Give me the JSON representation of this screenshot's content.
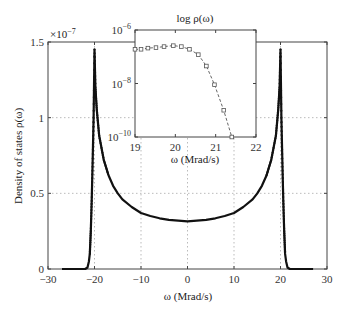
{
  "chart_data": [
    {
      "type": "scatter",
      "title": "",
      "xlabel": "ω (Mrad/s)",
      "ylabel": "Density of states ρ(ω)",
      "y_multiplier": "×10^-7",
      "xlim": [
        -30,
        30
      ],
      "ylim": [
        0,
        1.5
      ],
      "grid": true,
      "xticks": [
        -30,
        -20,
        -10,
        0,
        10,
        20,
        30
      ],
      "xtick_labels": [
        "−30",
        "−20",
        "−10",
        "0",
        "10",
        "20",
        "30"
      ],
      "yticks": [
        0,
        0.5,
        1,
        1.5
      ],
      "ytick_labels": [
        "0",
        "0.5",
        "1",
        "1.5"
      ],
      "series": [
        {
          "name": "Density of states",
          "x": [
            -27,
            -24,
            -22,
            -21.5,
            -21.2,
            -21,
            -20.8,
            -20.6,
            -20.4,
            -20.2,
            -20,
            -19.8,
            -19.5,
            -19,
            -18,
            -17,
            -16,
            -15,
            -14,
            -12,
            -10,
            -8,
            -6,
            -4,
            -2,
            0,
            2,
            4,
            6,
            8,
            10,
            12,
            14,
            15,
            16,
            17,
            18,
            19,
            19.5,
            19.8,
            20,
            20.2,
            20.4,
            20.6,
            20.8,
            21,
            21.2,
            21.5,
            22,
            24,
            27
          ],
          "values": [
            0,
            0,
            0,
            0.01,
            0.05,
            0.1,
            0.25,
            0.45,
            0.7,
            1.0,
            1.45,
            1.2,
            1.05,
            0.88,
            0.72,
            0.62,
            0.55,
            0.5,
            0.46,
            0.41,
            0.37,
            0.35,
            0.335,
            0.325,
            0.32,
            0.315,
            0.32,
            0.325,
            0.335,
            0.35,
            0.37,
            0.41,
            0.46,
            0.5,
            0.55,
            0.62,
            0.72,
            0.88,
            1.05,
            1.2,
            1.45,
            1.0,
            0.7,
            0.45,
            0.25,
            0.1,
            0.05,
            0.01,
            0,
            0,
            0
          ]
        }
      ]
    },
    {
      "type": "line",
      "title": "log ρ(ω)",
      "xlabel": "ω (Mrad/s)",
      "ylabel": "",
      "yscale": "log",
      "xlim": [
        19,
        22
      ],
      "ylim": [
        1e-10,
        1e-06
      ],
      "grid": false,
      "xticks": [
        19,
        20,
        21,
        22
      ],
      "xtick_labels": [
        "19",
        "20",
        "21",
        "22"
      ],
      "yticks": [
        1e-10,
        1e-08,
        1e-06
      ],
      "ytick_labels": [
        "10^-10",
        "10^-8",
        "10^-6"
      ],
      "series": [
        {
          "name": "log ρ(ω)",
          "marker": "square",
          "linestyle": "dashed",
          "x": [
            19.0,
            19.15,
            19.32,
            19.52,
            19.72,
            19.95,
            20.15,
            20.35,
            20.57,
            20.77,
            20.97,
            21.2,
            21.4
          ],
          "values": [
            1.9e-07,
            1.9e-07,
            2.1e-07,
            2.2e-07,
            2.4e-07,
            2.6e-07,
            2.4e-07,
            1.9e-07,
            1.2e-07,
            4.5e-08,
            9e-09,
            1e-09,
            1e-10
          ]
        }
      ]
    }
  ],
  "main": {
    "xlabel": "ω (Mrad/s)",
    "ylabel": "Density of states ρ(ω)",
    "multiplier_base": "×10",
    "multiplier_exp": "−7",
    "xticks": [
      "−30",
      "−20",
      "−10",
      "0",
      "10",
      "20",
      "30"
    ],
    "yticks": [
      "0",
      "0.5",
      "1",
      "1.5"
    ]
  },
  "inset": {
    "title": "log ρ(ω)",
    "xlabel": "ω (Mrad/s)",
    "xticks": [
      "19",
      "20",
      "21",
      "22"
    ],
    "ytick_base": "10",
    "ytick_exps": [
      "−6",
      "−8",
      "−10"
    ]
  },
  "colors": {
    "data": "#111111",
    "axes": "#444444",
    "grid": "#bbbbbb",
    "inset_marker": "#555555"
  }
}
